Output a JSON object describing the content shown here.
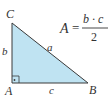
{
  "diagram": {
    "colors": {
      "fill": "#bfe3f2",
      "stroke": "#3a3a3a",
      "text": "#333333"
    },
    "vertices": {
      "A": {
        "label": "A"
      },
      "B": {
        "label": "B"
      },
      "C": {
        "label": "C"
      }
    },
    "sides": {
      "a": {
        "label": "a"
      },
      "b": {
        "label": "b"
      },
      "c": {
        "label": "c"
      }
    },
    "right_angle_at": "A",
    "formula": {
      "lhs": "A",
      "equals": "=",
      "numerator": "b · c",
      "denominator": "2"
    }
  }
}
